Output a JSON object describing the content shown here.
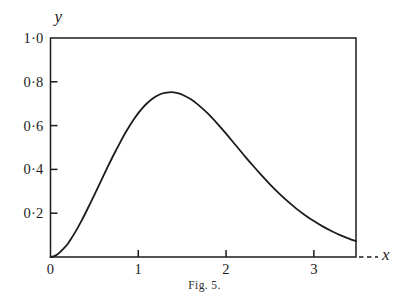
{
  "figure": {
    "caption": "Fig. 5.",
    "background_color": "#ffffff",
    "ink_color": "#1c1c1c"
  },
  "axes": {
    "y_axis_name": "y",
    "x_axis_name": "x",
    "y_tick_labels": [
      "1·0",
      "0·8",
      "0·6",
      "0·4",
      "0·2"
    ],
    "y_tick_values": [
      1.0,
      0.8,
      0.6,
      0.4,
      0.2
    ],
    "x_tick_labels": [
      "0",
      "1",
      "2",
      "3"
    ],
    "x_tick_values": [
      0,
      1,
      2,
      3
    ]
  },
  "chart_data": {
    "type": "line",
    "title": "Fig. 5.",
    "xlabel": "x",
    "ylabel": "y",
    "xlim": [
      0,
      3.48
    ],
    "ylim": [
      0,
      1.0
    ],
    "grid": false,
    "legend": null,
    "x_ticks": [
      0,
      1,
      2,
      3
    ],
    "y_ticks": [
      0,
      0.2,
      0.4,
      0.6,
      0.8,
      1.0
    ],
    "x_tick_labels": [
      "0",
      "1",
      "2",
      "3"
    ],
    "y_tick_labels": [
      "",
      "0·2",
      "0·4",
      "0·6",
      "0·8",
      "1·0"
    ],
    "axis_style": "box-frame-open-right",
    "x_axis_dashed_extension": true,
    "series": [
      {
        "name": "curve",
        "color": "#1c1c1c",
        "peak": {
          "x": 1.0,
          "y": 0.85
        },
        "x": [
          0.0,
          0.05,
          0.1,
          0.15,
          0.2,
          0.25,
          0.3,
          0.35,
          0.4,
          0.45,
          0.5,
          0.55,
          0.6,
          0.65,
          0.7,
          0.75,
          0.8,
          0.85,
          0.9,
          0.95,
          1.0,
          1.05,
          1.1,
          1.15,
          1.2,
          1.25,
          1.3,
          1.35,
          1.4,
          1.45,
          1.5,
          1.6,
          1.7,
          1.8,
          1.9,
          2.0,
          2.1,
          2.2,
          2.3,
          2.4,
          2.5,
          2.6,
          2.7,
          2.8,
          2.9,
          3.0,
          3.1,
          3.2,
          3.3,
          3.4,
          3.48
        ],
        "y": [
          0.0,
          0.005,
          0.019,
          0.039,
          0.062,
          0.093,
          0.126,
          0.163,
          0.202,
          0.243,
          0.284,
          0.326,
          0.368,
          0.41,
          0.451,
          0.49,
          0.528,
          0.565,
          0.598,
          0.629,
          0.657,
          0.681,
          0.702,
          0.719,
          0.733,
          0.743,
          0.749,
          0.752,
          0.752,
          0.748,
          0.741,
          0.72,
          0.689,
          0.652,
          0.609,
          0.563,
          0.515,
          0.467,
          0.42,
          0.375,
          0.332,
          0.292,
          0.255,
          0.221,
          0.191,
          0.164,
          0.14,
          0.119,
          0.1,
          0.084,
          0.072
        ]
      }
    ]
  }
}
